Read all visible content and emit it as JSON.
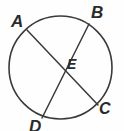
{
  "figure": {
    "background_color": "#fefefe",
    "stroke_color": "#3a3a3a",
    "label_color": "#2b2b2b",
    "width": 124,
    "height": 131
  },
  "circle": {
    "name": "circle-outline",
    "center_x": 60.5,
    "center_y": 67.5,
    "radius": 51.5,
    "stroke_width": 1.6
  },
  "chords": [
    {
      "name": "chord-AC",
      "from_label": "A",
      "to_label": "C",
      "x1": 27,
      "y1": 30,
      "x2": 98,
      "y2": 105,
      "stroke_width": 1.5
    },
    {
      "name": "chord-BD",
      "from_label": "B",
      "to_label": "D",
      "x1": 89,
      "y1": 24,
      "x2": 42,
      "y2": 118,
      "stroke_width": 1.5
    }
  ],
  "intersection": {
    "name": "point-E",
    "label": "E",
    "x": 59,
    "y": 67
  },
  "labels": {
    "A": "A",
    "B": "B",
    "C": "C",
    "D": "D",
    "E": "E"
  }
}
